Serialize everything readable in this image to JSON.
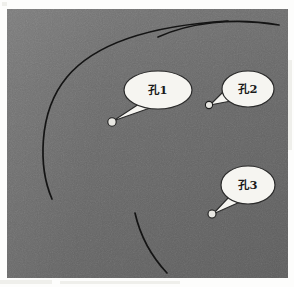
{
  "figure": {
    "panel": {
      "background_color": "#6d6d6d",
      "page_color": "#fdfdfc",
      "width": 281,
      "height": 269
    },
    "ink_color": "#141414",
    "balloon_fill_color": "#f6f5f1",
    "balloon_stroke_color": "#2a2a2a",
    "marker_fill_color": "#e8e7e2",
    "marker_stroke_color": "#1d1d1d"
  },
  "callouts": [
    {
      "id": "callout-1",
      "label": "孔1",
      "balloon": {
        "cx": 151,
        "cy": 81,
        "rx": 34,
        "ry": 19
      },
      "text_pos": {
        "x": 151,
        "y": 85
      },
      "tail": "M 132,95 L 143,99 L 106,112 Z",
      "marker": {
        "cx": 105,
        "cy": 113,
        "r": 4.2
      }
    },
    {
      "id": "callout-2",
      "label": "孔2",
      "balloon": {
        "cx": 241,
        "cy": 80,
        "rx": 26,
        "ry": 18
      },
      "text_pos": {
        "x": 241,
        "y": 84
      },
      "tail": "M 221,78 L 224,92 L 203,96 Z",
      "marker": {
        "cx": 202,
        "cy": 96,
        "r": 3.6
      }
    },
    {
      "id": "callout-3",
      "label": "孔3",
      "balloon": {
        "cx": 241,
        "cy": 176,
        "rx": 27,
        "ry": 19
      },
      "text_pos": {
        "x": 241,
        "y": 180
      },
      "tail": "M 222,188 L 233,193 L 206,205 Z",
      "marker": {
        "cx": 205,
        "cy": 205,
        "r": 4.0
      }
    }
  ],
  "arcs": [
    {
      "id": "arc-left-large",
      "path": "M 221,12 C 170,15 95,26 60,68 C 30,104 32,160 45,190",
      "width": 1.7,
      "dash": "none"
    },
    {
      "id": "arc-top-right",
      "path": "M 151,28 C 182,14 226,8 272,16",
      "width": 1.7,
      "dash": "none"
    },
    {
      "id": "arc-bottom",
      "path": "M 128,204 C 133,226 145,248 160,264",
      "width": 1.7,
      "dash": "none"
    }
  ],
  "margin_smudges": [
    {
      "x": 2,
      "y": 2,
      "w": 5,
      "h": 4
    },
    {
      "x": 0,
      "y": 280,
      "w": 52,
      "h": 4
    },
    {
      "x": 60,
      "y": 281,
      "w": 120,
      "h": 3
    },
    {
      "x": 288,
      "y": 60,
      "w": 4,
      "h": 90
    }
  ]
}
